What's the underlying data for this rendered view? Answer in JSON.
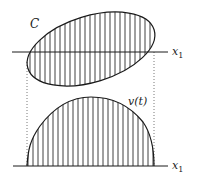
{
  "diagram": {
    "top_panel": {
      "region_label": "C",
      "axis_label": "x",
      "axis_subscript": "1",
      "axis_y": 52,
      "ellipse": {
        "cx": 91,
        "cy": 49,
        "rx": 66,
        "ry": 33,
        "rotation_deg": -17
      },
      "hatch": {
        "x_start": 30,
        "x_end": 154,
        "step": 5
      }
    },
    "bottom_panel": {
      "curve_label": "v(t)",
      "axis_label": "x",
      "axis_subscript": "1",
      "axis_y": 166,
      "hatch": {
        "x_start": 28,
        "x_end": 154,
        "step": 5
      }
    },
    "projection_lines": {
      "left_x": 27,
      "right_x": 154
    },
    "colors": {
      "stroke": "#1a1a1a",
      "hatch": "#2a2a2a",
      "dotted": "#555555",
      "background": "#ffffff"
    }
  }
}
